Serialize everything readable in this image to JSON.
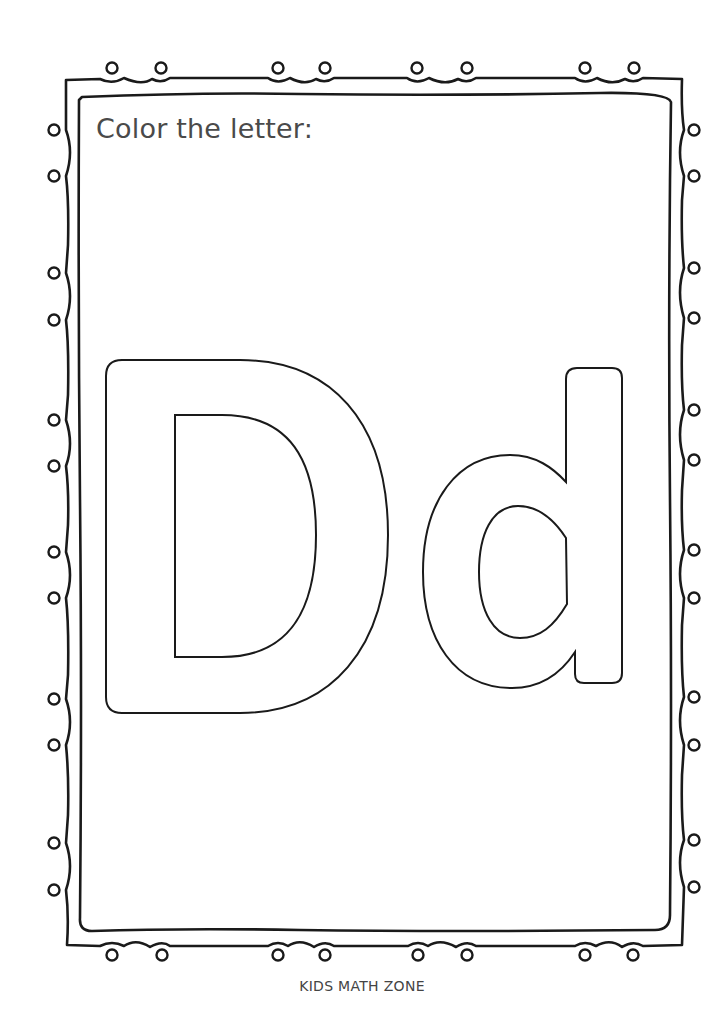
{
  "worksheet": {
    "instruction": "Color the letter:",
    "letter_uppercase": "D",
    "letter_lowercase": "d",
    "footer": "KIDS MATH ZONE"
  },
  "style": {
    "outline_color": "#1a1a1a",
    "text_color": "#4a4a4a",
    "background": "#ffffff"
  },
  "border": {
    "loop_style": "hand-drawn double frame with curly loops",
    "top_loops_x": [
      112,
      161,
      278,
      325,
      417,
      467,
      585,
      634
    ],
    "bottom_loops_x": [
      112,
      162,
      278,
      325,
      418,
      467,
      585,
      633
    ],
    "left_loops_y": [
      130,
      176,
      273,
      320,
      420,
      466,
      552,
      598,
      699,
      745,
      843,
      890
    ],
    "right_loops_y": [
      130,
      176,
      268,
      318,
      410,
      460,
      550,
      598,
      697,
      745,
      840,
      887
    ]
  }
}
